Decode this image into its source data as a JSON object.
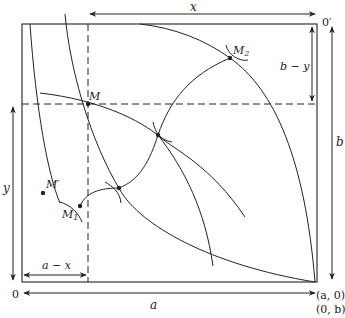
{
  "diagram": {
    "type": "edgeworth-box",
    "colors": {
      "line": "#222222",
      "background": "#ffffff"
    },
    "labels": {
      "x_top": "x",
      "origin_prime": "0′",
      "b_minus_y": "b − y",
      "b_right": "b",
      "y_left": "y",
      "a_minus_x": "a − x",
      "origin": "0",
      "a_bottom": "a",
      "corner_a0": "(a, 0)",
      "corner_0b": "(0, b)",
      "point_M": "M",
      "point_M1": "M",
      "point_M1_sub": "1",
      "point_M2": "M",
      "point_M2_sub": "2",
      "point_Mprime": "M′"
    },
    "points": {
      "M": [
        88,
        104
      ],
      "M1": [
        80,
        206
      ],
      "M2": [
        230,
        58
      ],
      "P1": [
        158,
        135
      ],
      "P2": [
        119,
        188
      ],
      "Mprime": [
        43,
        193
      ]
    }
  }
}
